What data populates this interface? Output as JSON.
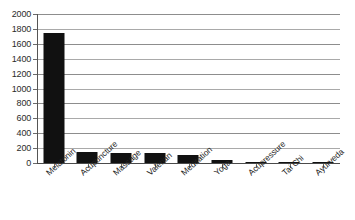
{
  "chart_data": {
    "type": "bar",
    "title": "",
    "subtitle": "",
    "xlabel": "",
    "ylabel": "",
    "categories": [
      "Melatonin",
      "Acupuncture",
      "Massage",
      "Valerian",
      "Meditation",
      "Yoga",
      "Acupressure",
      "Tai Chi",
      "Ayurveda"
    ],
    "values": [
      1750,
      150,
      130,
      130,
      110,
      45,
      20,
      6,
      4
    ],
    "ylim": [
      0,
      2000
    ],
    "ytick_labels": [
      "0",
      "200",
      "400",
      "600",
      "800",
      "1000",
      "1200",
      "1400",
      "1600",
      "1800",
      "2000"
    ],
    "ytick_values": [
      0,
      200,
      400,
      600,
      800,
      1000,
      1200,
      1400,
      1600,
      1800,
      2000
    ],
    "grid": "horizontal",
    "legend": "none",
    "bar_color": "#111111",
    "grid_color": "#8d8d8d",
    "axis_color": "#555555"
  }
}
